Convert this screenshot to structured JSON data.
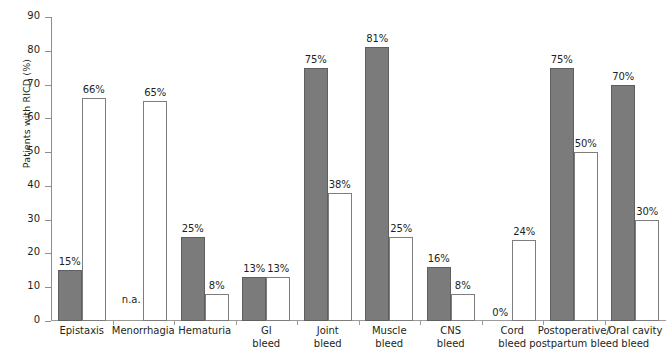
{
  "chart_data": {
    "type": "bar",
    "title": "",
    "xlabel": "",
    "ylabel": "Patients with RICD (%)",
    "ylim": [
      0,
      90
    ],
    "ytick_values": [
      0,
      10,
      20,
      30,
      40,
      50,
      60,
      70,
      80,
      90
    ],
    "ytick_labels": [
      "0",
      "10",
      "20",
      "30",
      "40",
      "50",
      "60",
      "70",
      "80",
      "90"
    ],
    "grid": false,
    "legend": "none",
    "na_text": "n.a.",
    "categories": [
      "Epistaxis",
      "Menorrhagia",
      "Hematuria",
      "GI bleed",
      "Joint bleed",
      "Muscle bleed",
      "CNS bleed",
      "Cord bleed",
      "Postoperative/ postpartum bleed",
      "Oral cavity bleed"
    ],
    "category_lines": [
      [
        "Epistaxis"
      ],
      [
        "Menorrhagia"
      ],
      [
        "Hematuria"
      ],
      [
        "GI",
        "bleed"
      ],
      [
        "Joint",
        "bleed"
      ],
      [
        "Muscle",
        "bleed"
      ],
      [
        "CNS",
        "bleed"
      ],
      [
        "Cord",
        "bleed"
      ],
      [
        "Postoperative/",
        "postpartum bleed"
      ],
      [
        "Oral cavity",
        "bleed"
      ]
    ],
    "series": [
      {
        "name": "filled",
        "style": "filled-gray",
        "color": "#7b7b7b",
        "values": [
          15,
          null,
          25,
          13,
          75,
          81,
          16,
          0,
          75,
          70
        ],
        "labels": [
          "15%",
          "n.a.",
          "25%",
          "13%",
          "75%",
          "81%",
          "16%",
          "0%",
          "75%",
          "70%"
        ]
      },
      {
        "name": "hollow",
        "style": "hollow-white",
        "color": "#ffffff",
        "values": [
          66,
          65,
          8,
          13,
          38,
          25,
          8,
          24,
          50,
          30
        ],
        "labels": [
          "66%",
          "65%",
          "8%",
          "13%",
          "38%",
          "25%",
          "8%",
          "24%",
          "50%",
          "30%"
        ]
      }
    ]
  }
}
